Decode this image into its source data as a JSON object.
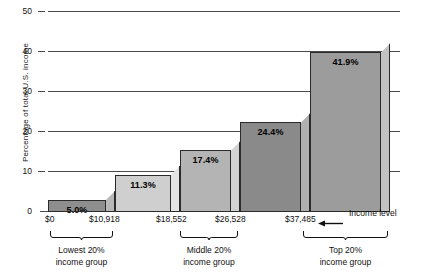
{
  "chart_data": {
    "type": "bar",
    "title": "",
    "xlabel": "Income level",
    "ylabel": "Percentage of total U.S. income",
    "ylim": [
      0,
      50
    ],
    "yticks": [
      0,
      10,
      20,
      30,
      40,
      50
    ],
    "ytick_labels": [
      "0",
      "10",
      "20",
      "30",
      "40",
      "50"
    ],
    "grid": true,
    "legend": false,
    "categories": [
      "Lowest 20% income group",
      "Second 20%",
      "Middle 20% income group",
      "Fourth 20%",
      "Top 20% income group"
    ],
    "values": [
      5.0,
      11.3,
      17.4,
      24.4,
      41.9
    ],
    "value_labels": [
      "5.0%",
      "11.3%",
      "17.4%",
      "24.4%",
      "41.9%"
    ],
    "bar_colors": [
      "#8e8e8e",
      "#cfcfcf",
      "#b4b4b4",
      "#8a8a8a",
      "#9c9c9c"
    ],
    "bar_side_colors": [
      "#b8b8b8",
      "#e4e4e4",
      "#d2d2d2",
      "#b0b0b0",
      "#c2c2c2"
    ],
    "x_boundaries": [
      "$0",
      "$10,918",
      "$18,552",
      "$26,528",
      "$37,485"
    ],
    "annotation": "Income level",
    "groups": [
      {
        "line1": "Lowest 20%",
        "line2": "income group"
      },
      {
        "line1": "Middle 20%",
        "line2": "income group"
      },
      {
        "line1": "Top 20%",
        "line2": "income group"
      }
    ]
  },
  "axis": {
    "y_title": "Percentage of total U.S. income"
  }
}
